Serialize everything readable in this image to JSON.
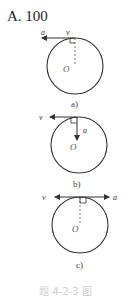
{
  "header": {
    "title": "A. 100"
  },
  "figures": [
    {
      "id": "a",
      "label": "a)",
      "velocity_label": "v",
      "accel_label": "a",
      "center_label": "O"
    },
    {
      "id": "b",
      "label": "b)",
      "velocity_label": "v",
      "accel_label": "a",
      "center_label": "O"
    },
    {
      "id": "c",
      "label": "c)",
      "velocity_label": "v",
      "accel_label": "a",
      "center_label": "O"
    }
  ],
  "caption": "题 4-2-3 图",
  "colors": {
    "line": "#333333",
    "caption": "#cfcfcf"
  }
}
